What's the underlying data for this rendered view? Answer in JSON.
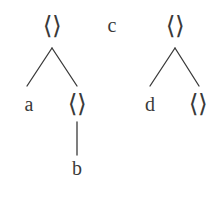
{
  "diagram": {
    "type": "syntax-tree-forest",
    "stroke_color": "#3a3a3a",
    "background_color": "#ffffff",
    "bracket_glyph": "⟨⟩",
    "trees": [
      {
        "id": "left-tree",
        "nodes": [
          {
            "id": "L0",
            "label": "⟨⟩",
            "kind": "bracket",
            "x": 52,
            "y": 25
          },
          {
            "id": "L1",
            "label": "a",
            "kind": "terminal",
            "x": 29,
            "y": 104
          },
          {
            "id": "L2",
            "label": "⟨⟩",
            "kind": "bracket",
            "x": 77,
            "y": 103
          },
          {
            "id": "L3",
            "label": "b",
            "kind": "terminal",
            "x": 77,
            "y": 168
          }
        ],
        "edges": [
          {
            "from": "L0",
            "to": "L1",
            "x1": 52,
            "y1": 48,
            "x2": 27,
            "y2": 86
          },
          {
            "from": "L0",
            "to": "L2",
            "x1": 52,
            "y1": 48,
            "x2": 77,
            "y2": 86
          },
          {
            "from": "L2",
            "to": "L3",
            "x1": 77,
            "y1": 122,
            "x2": 77,
            "y2": 155
          }
        ]
      },
      {
        "id": "middle-node",
        "nodes": [
          {
            "id": "M0",
            "label": "c",
            "kind": "terminal",
            "x": 112,
            "y": 25
          }
        ],
        "edges": []
      },
      {
        "id": "right-tree",
        "nodes": [
          {
            "id": "R0",
            "label": "⟨⟩",
            "kind": "bracket",
            "x": 175,
            "y": 25
          },
          {
            "id": "R1",
            "label": "d",
            "kind": "terminal",
            "x": 150,
            "y": 104
          },
          {
            "id": "R2",
            "label": "⟨⟩",
            "kind": "bracket",
            "x": 198,
            "y": 103
          }
        ],
        "edges": [
          {
            "from": "R0",
            "to": "R1",
            "x1": 175,
            "y1": 48,
            "x2": 150,
            "y2": 86
          },
          {
            "from": "R0",
            "to": "R2",
            "x1": 175,
            "y1": 48,
            "x2": 199,
            "y2": 86
          }
        ]
      }
    ]
  }
}
